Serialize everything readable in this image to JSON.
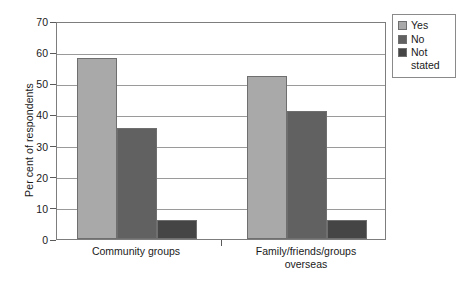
{
  "chart_data": {
    "type": "bar",
    "title": "",
    "subtitle": "",
    "xlabel": "",
    "ylabel": "Per cent of respondents",
    "categories": [
      "Community groups",
      "Family/friends/groups overseas"
    ],
    "category_lines": [
      [
        "Community groups"
      ],
      [
        "Family/friends/groups",
        "overseas"
      ]
    ],
    "series": [
      {
        "name": "Yes",
        "color": "#a9a9a9",
        "values": [
          58,
          52.5
        ]
      },
      {
        "name": "No",
        "color": "#616161",
        "values": [
          35.5,
          41
        ]
      },
      {
        "name": "Not stated",
        "color": "#454545",
        "values": [
          6,
          6
        ]
      }
    ],
    "ylim": [
      0,
      70
    ],
    "yticks": [
      0,
      10,
      20,
      30,
      40,
      50,
      60,
      70
    ],
    "ytick_labels": [
      "0",
      "10",
      "20",
      "30",
      "40",
      "50",
      "60",
      "70"
    ],
    "grid": true,
    "grid_axis": "y",
    "legend_position": "right-top",
    "legend_entries": [
      {
        "label": "Yes",
        "lines": [
          "Yes"
        ],
        "color": "#a9a9a9"
      },
      {
        "label": "No",
        "lines": [
          "No"
        ],
        "color": "#616161"
      },
      {
        "label": "Not stated",
        "lines": [
          "Not",
          "stated"
        ],
        "color": "#454545"
      }
    ]
  },
  "axis": {
    "y_title": "Per cent of respondents"
  },
  "colors": {
    "yes": "#a9a9a9",
    "no": "#616161",
    "not_stated": "#454545",
    "frame": "#7d7d7d",
    "grid": "#9a9a9a",
    "background": "#ffffff"
  }
}
